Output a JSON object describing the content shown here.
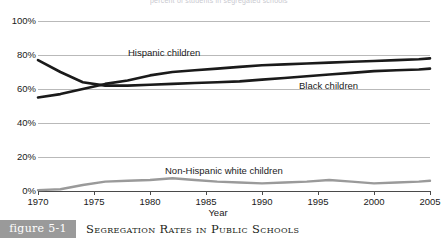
{
  "figure": {
    "tag": "figure 5-1",
    "caption": "Segregation Rates in Public Schools",
    "top_cut_text": "percent of students in segregated schools"
  },
  "axes": {
    "x_title": "Year",
    "y_ticks": [
      "0%",
      "20%",
      "40%",
      "60%",
      "80%",
      "100%"
    ],
    "x_ticks": [
      "1970",
      "1975",
      "1980",
      "1985",
      "1990",
      "1995",
      "2000",
      "2005"
    ]
  },
  "labels": {
    "hispanic": "Hispanic children",
    "black": "Black children",
    "white": "Non-Hispanic white children"
  },
  "colors": {
    "dark_line": "#1a1a1a",
    "gray_line": "#9a9a9a",
    "gridline": "#b9b9b9",
    "axis": "#4a4a4a",
    "tag_background": "#9a9a9a"
  },
  "chart_data": {
    "type": "line",
    "title": "Segregation Rates in Public Schools",
    "xlabel": "Year",
    "ylabel": "",
    "xlim": [
      1970,
      2005
    ],
    "ylim": [
      0,
      100
    ],
    "grid": true,
    "legend": "inline-labels",
    "x": [
      1970,
      1972,
      1974,
      1976,
      1978,
      1980,
      1982,
      1984,
      1986,
      1988,
      1990,
      1992,
      1994,
      1996,
      1998,
      2000,
      2002,
      2004,
      2005
    ],
    "series": [
      {
        "name": "Hispanic children",
        "color": "#1a1a1a",
        "values": [
          55,
          57,
          60,
          63,
          65,
          68,
          70,
          71,
          72,
          73,
          74,
          74.5,
          75,
          75.5,
          76,
          76.5,
          77,
          77.5,
          78
        ]
      },
      {
        "name": "Black children",
        "color": "#1a1a1a",
        "values": [
          77,
          70,
          64,
          62,
          62,
          62.5,
          63,
          63.5,
          64,
          64.5,
          65.5,
          66.5,
          67.5,
          68.5,
          69.5,
          70.5,
          71,
          71.5,
          72
        ]
      },
      {
        "name": "Non-Hispanic white children",
        "color": "#9a9a9a",
        "values": [
          0.5,
          1,
          3.5,
          5.5,
          6,
          6.5,
          7.5,
          6.5,
          5.5,
          5,
          4.5,
          5,
          5.5,
          6.5,
          5.5,
          4.5,
          5,
          5.5,
          6
        ]
      }
    ]
  }
}
